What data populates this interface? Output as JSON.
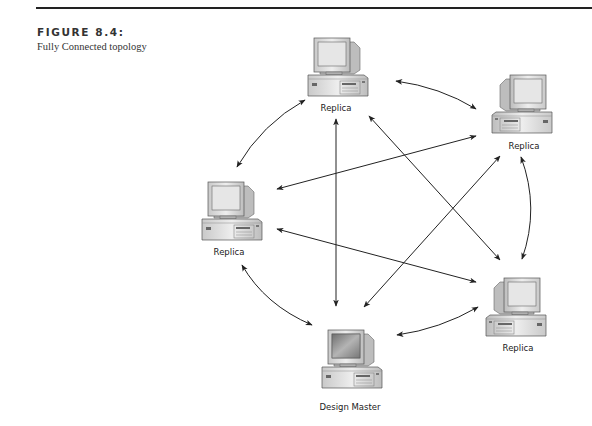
{
  "figure": {
    "number": "FIGURE 8.4:",
    "caption": "Fully Connected topology"
  },
  "nodes": [
    {
      "id": "top",
      "label": "Replica",
      "role": "replica",
      "icon": "computer-icon",
      "x": 336,
      "y": 58,
      "label_y": 103
    },
    {
      "id": "top-right",
      "label": "Replica",
      "role": "replica",
      "icon": "computer-icon",
      "x": 524,
      "y": 97,
      "label_y": 140
    },
    {
      "id": "left",
      "label": "Replica",
      "role": "replica",
      "icon": "computer-icon",
      "x": 229,
      "y": 207,
      "label_y": 246
    },
    {
      "id": "bottom-right",
      "label": "Replica",
      "role": "replica",
      "icon": "computer-icon",
      "x": 518,
      "y": 300,
      "label_y": 343
    },
    {
      "id": "bottom",
      "label": "Design Master",
      "role": "design-master",
      "icon": "computer-icon",
      "x": 348,
      "y": 356,
      "label_y": 401
    }
  ],
  "connections": [
    {
      "from": "top",
      "to": "left",
      "style": "curved"
    },
    {
      "from": "top",
      "to": "top-right",
      "style": "curved"
    },
    {
      "from": "top-right",
      "to": "bottom-right",
      "style": "curved"
    },
    {
      "from": "bottom-right",
      "to": "bottom",
      "style": "curved"
    },
    {
      "from": "bottom",
      "to": "left",
      "style": "curved"
    },
    {
      "from": "top",
      "to": "bottom",
      "style": "straight"
    },
    {
      "from": "top",
      "to": "bottom-right",
      "style": "straight"
    },
    {
      "from": "top-right",
      "to": "left",
      "style": "straight"
    },
    {
      "from": "top-right",
      "to": "bottom",
      "style": "straight"
    },
    {
      "from": "left",
      "to": "bottom-right",
      "style": "straight"
    }
  ],
  "colors": {
    "arrow": "#222222",
    "rule": "#222222",
    "monitor_body": "#d8d8d8",
    "screen_replica": "#e6e6e6",
    "screen_master": "#8a8a8a"
  }
}
